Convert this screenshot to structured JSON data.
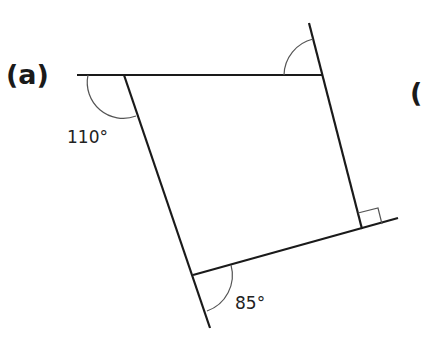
{
  "figure": {
    "part_label": "(a)",
    "next_part_label_partial": "(",
    "angles": {
      "top_left": "110°",
      "bottom_left": "85°",
      "bottom_right": "right-angle",
      "top_right": "unknown"
    }
  },
  "colors": {
    "line": "#1a1a1a",
    "arc": "#555555",
    "background": "#ffffff"
  }
}
